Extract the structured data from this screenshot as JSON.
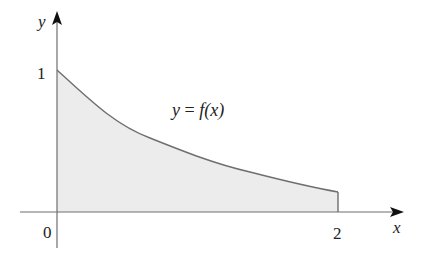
{
  "diagram": {
    "type": "area-under-curve",
    "axes": {
      "x_label": "x",
      "y_label": "y",
      "origin_label": "0",
      "x_tick_label": "2",
      "y_tick_label": "1"
    },
    "curve": {
      "label_lhs": "y",
      "label_eq": "=",
      "label_rhs": "f(x)",
      "x_range": [
        0,
        2
      ],
      "f_at_0": 1,
      "f_at_2_approx": 0.14,
      "shape": "decreasing convex, exponential-like decay"
    },
    "region": {
      "description": "shaded area under y = f(x) from x = 0 to x = 2",
      "fill_color": "#e9e9e9",
      "stroke_color": "#777777"
    }
  }
}
